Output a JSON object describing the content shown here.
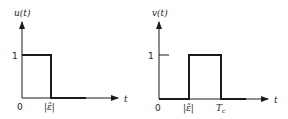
{
  "left_plot": {
    "ylabel": "u(t)",
    "xlabel": "t",
    "y_tick": "1",
    "origin": "0",
    "x_tick": "|ε̃|"
  },
  "right_plot": {
    "ylabel": "v(t)",
    "xlabel": "t",
    "y_tick": "1",
    "origin": "0",
    "x_tick_1": "|ε̃|",
    "x_tick_2": "T",
    "x_tick_2_sub": "c"
  },
  "colors": {
    "line": "#1a1a1a",
    "text": "#222222"
  }
}
